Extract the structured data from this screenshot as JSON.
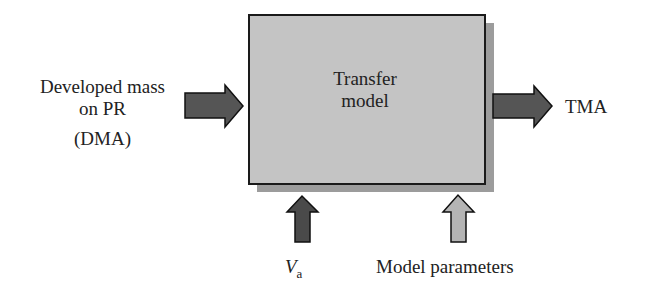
{
  "diagram": {
    "box": {
      "line1": "Transfer",
      "line2": "model",
      "fill": "#c4c4c4",
      "shadow": "#9c9c9c"
    },
    "input_left": {
      "line1": "Developed mass",
      "line2": "on PR",
      "line3": "(DMA)",
      "arrow_color": "#555555"
    },
    "output_right": {
      "label": "TMA",
      "arrow_color": "#555555"
    },
    "input_bottom_1": {
      "label_main": "V",
      "label_sub": "a",
      "arrow_color": "#4a4a4a"
    },
    "input_bottom_2": {
      "label": "Model parameters",
      "arrow_color": "#b4b4b4"
    }
  }
}
